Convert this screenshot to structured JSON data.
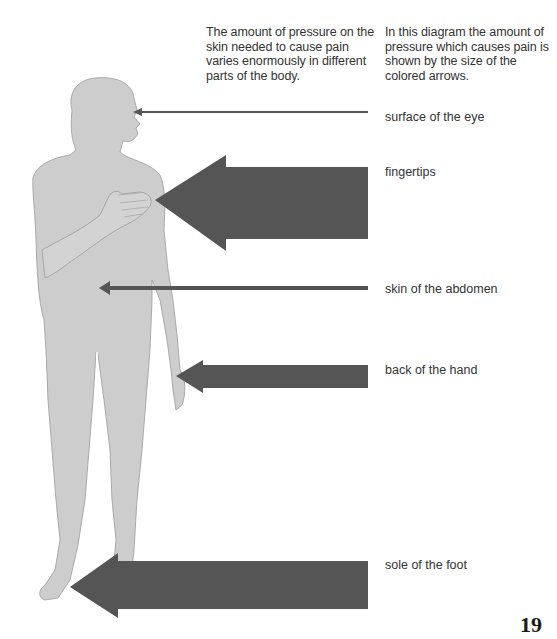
{
  "intro": {
    "left": "The amount of pressure on the skin needed to cause pain varies enormously in different parts of the body.",
    "right": "In this diagram the amount of pressure which causes pain is shown by the size of the colored arrows."
  },
  "colors": {
    "body": "#cdcdcd",
    "body_outline": "#9a9a9a",
    "arrow": "#555555",
    "text": "#333333"
  },
  "labels": [
    {
      "id": "eye",
      "text": "surface of the eye",
      "top": 110
    },
    {
      "id": "fingertips",
      "text": "fingertips",
      "top": 165
    },
    {
      "id": "abdomen",
      "text": "skin of the abdomen",
      "top": 282
    },
    {
      "id": "hand",
      "text": "back of the hand",
      "top": 363
    },
    {
      "id": "foot",
      "text": "sole of the foot",
      "top": 558
    }
  ],
  "page_number": "19"
}
